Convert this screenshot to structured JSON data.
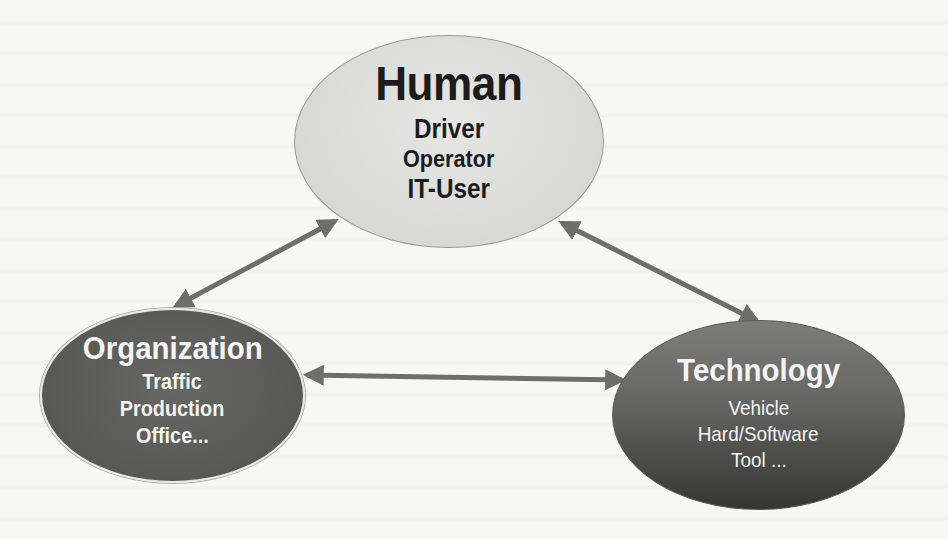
{
  "diagram": {
    "colors": {
      "background": "#f7f7f5",
      "human_fill": "#dcdcda",
      "organization_fill": "#585856",
      "technology_fill_top": "#7c7c7a",
      "technology_fill_bottom": "#353533",
      "arrow": "#6e6e6c"
    },
    "nodes": {
      "human": {
        "title": "Human",
        "items": [
          "Driver",
          "Operator",
          "IT-User"
        ]
      },
      "organization": {
        "title": "Organization",
        "items": [
          "Traffic",
          "Production",
          "Office..."
        ]
      },
      "technology": {
        "title": "Technology",
        "items": [
          "Vehicle",
          "Hard/Software",
          "Tool ..."
        ]
      }
    },
    "edges": [
      {
        "from": "organization",
        "to": "human",
        "type": "bidirectional"
      },
      {
        "from": "human",
        "to": "technology",
        "type": "bidirectional"
      },
      {
        "from": "organization",
        "to": "technology",
        "type": "bidirectional"
      }
    ]
  }
}
